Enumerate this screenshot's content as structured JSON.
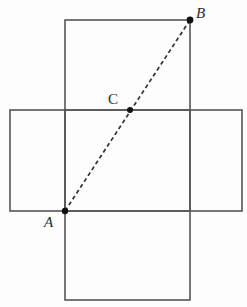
{
  "figure": {
    "width": 247,
    "height": 307,
    "background_color": "#fdfdfd",
    "stroke_color": "#555555",
    "dash_color": "#333333",
    "point_color": "#111111",
    "label_color": "#2b2b2b",
    "stroke_width": 1.6,
    "dash_width": 1.7,
    "dash_pattern": "4 3"
  },
  "shapes": {
    "vertical_column": {
      "name": "vertical-column",
      "x": 65,
      "y": 20,
      "width": 125,
      "height": 280
    },
    "horizontal_band": {
      "name": "horizontal-band",
      "x": 10,
      "y": 110,
      "width": 232,
      "height": 101
    },
    "top_square": {
      "name": "top-square",
      "x": 65,
      "y": 20,
      "width": 125,
      "height": 90
    },
    "bottom_square": {
      "name": "bottom-square",
      "x": 65,
      "y": 211,
      "width": 125,
      "height": 89
    },
    "left_square": {
      "name": "left-square",
      "x": 10,
      "y": 110,
      "width": 55,
      "height": 101
    },
    "right_square": {
      "name": "right-square",
      "x": 190,
      "y": 110,
      "width": 52,
      "height": 101
    }
  },
  "diagonal": {
    "name": "dashed-diagonal-ab",
    "from": {
      "x": 65,
      "y": 211
    },
    "to": {
      "x": 190,
      "y": 20
    },
    "style": "dashed"
  },
  "points": [
    {
      "id": "A",
      "label": "A",
      "x": 65,
      "y": 211,
      "radius": 3.2,
      "label_x": 44,
      "label_y": 215,
      "label_style": "italic"
    },
    {
      "id": "C",
      "label": "C",
      "x": 130,
      "y": 110,
      "radius": 3.0,
      "label_x": 108,
      "label_y": 92,
      "label_style": "upright"
    },
    {
      "id": "B",
      "label": "B",
      "x": 190,
      "y": 20,
      "radius": 3.4,
      "label_x": 196,
      "label_y": 6,
      "label_style": "italic"
    }
  ]
}
